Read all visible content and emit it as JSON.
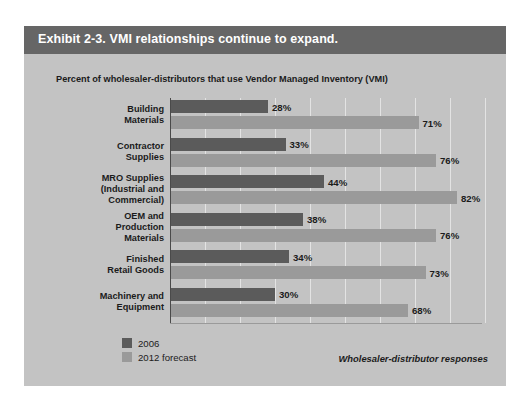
{
  "exhibit": {
    "title": "Exhibit 2-3. VMI relationships continue to expand.",
    "subtitle": "Percent of wholesaler-distributors that use Vendor Managed Inventory (VMI)",
    "source_note": "Wholesaler-distributor responses"
  },
  "legend": {
    "items": [
      {
        "label": "2006",
        "color": "#5b5b5b"
      },
      {
        "label": "2012 forecast",
        "color": "#9a9a9a"
      }
    ]
  },
  "chart_data": {
    "type": "bar",
    "orientation": "horizontal",
    "title": "Exhibit 2-3. VMI relationships continue to expand.",
    "subtitle": "Percent of wholesaler-distributors that use Vendor Managed Inventory (VMI)",
    "xlabel": "",
    "ylabel": "",
    "xlim": [
      0,
      90
    ],
    "grid": true,
    "legend_position": "bottom-left",
    "annotation": "Wholesaler-distributor responses",
    "categories": [
      "Building Materials",
      "Contractor Supplies",
      "MRO Supplies (Industrial and Commercial)",
      "OEM and Production Materials",
      "Finished Retail Goods",
      "Machinery and Equipment"
    ],
    "category_lines": [
      [
        "Building",
        "Materials"
      ],
      [
        "Contractor",
        "Supplies"
      ],
      [
        "MRO Supplies",
        "(Industrial and",
        "Commercial)"
      ],
      [
        "OEM and",
        "Production",
        "Materials"
      ],
      [
        "Finished",
        "Retail Goods"
      ],
      [
        "Machinery and",
        "Equipment"
      ]
    ],
    "series": [
      {
        "name": "2006",
        "color": "#5b5b5b",
        "values": [
          28,
          33,
          44,
          38,
          34,
          30
        ],
        "labels": [
          "28%",
          "33%",
          "44%",
          "38%",
          "34%",
          "30%"
        ]
      },
      {
        "name": "2012 forecast",
        "color": "#9a9a9a",
        "values": [
          71,
          76,
          82,
          76,
          73,
          68
        ],
        "labels": [
          "71%",
          "76%",
          "82%",
          "76%",
          "73%",
          "68%"
        ]
      }
    ]
  }
}
